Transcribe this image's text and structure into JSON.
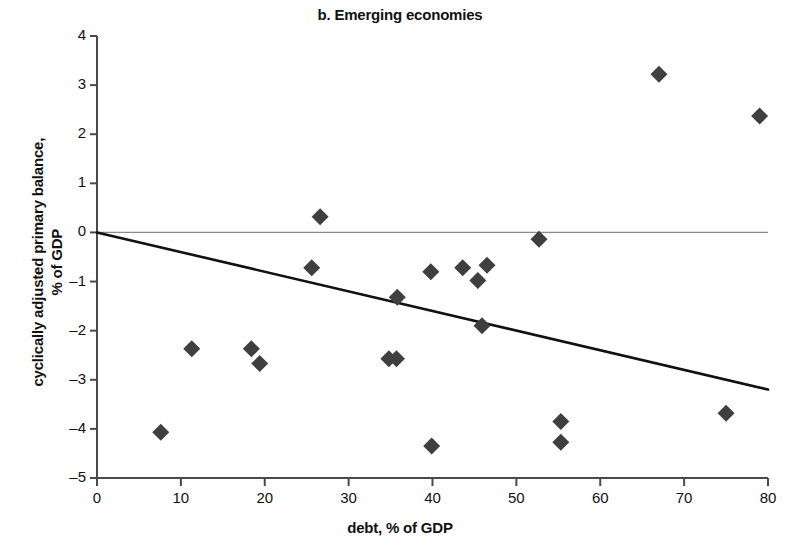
{
  "chart_data": {
    "type": "scatter",
    "title": "b. Emerging economies",
    "xlabel": "debt, % of GDP",
    "ylabel": "cyclically adjusted primary balance,\n% of GDP",
    "ylabel_line1": "cyclically adjusted primary balance,",
    "ylabel_line2": "% of GDP",
    "xlim": [
      0,
      80
    ],
    "ylim": [
      -5,
      4
    ],
    "xticks": [
      0,
      10,
      20,
      30,
      40,
      50,
      60,
      70,
      80
    ],
    "yticks": [
      4,
      3,
      2,
      1,
      0,
      -1,
      -2,
      -3,
      -4,
      -5
    ],
    "xtick_labels": [
      "0",
      "10",
      "20",
      "30",
      "40",
      "50",
      "60",
      "70",
      "80"
    ],
    "ytick_labels": [
      "4",
      "3",
      "2",
      "1",
      "0",
      "–1",
      "–2",
      "–3",
      "–4",
      "–5"
    ],
    "grid": false,
    "legend": null,
    "marker": "diamond",
    "marker_color": "#3f3f3f",
    "points": [
      {
        "x": 7.6,
        "y": -4.07
      },
      {
        "x": 11.3,
        "y": -2.37
      },
      {
        "x": 18.4,
        "y": -2.37
      },
      {
        "x": 19.4,
        "y": -2.67
      },
      {
        "x": 26.6,
        "y": 0.32
      },
      {
        "x": 25.6,
        "y": -0.72
      },
      {
        "x": 34.8,
        "y": -2.57
      },
      {
        "x": 35.7,
        "y": -2.57
      },
      {
        "x": 35.8,
        "y": -1.32
      },
      {
        "x": 39.8,
        "y": -0.8
      },
      {
        "x": 39.9,
        "y": -4.35
      },
      {
        "x": 43.6,
        "y": -0.72
      },
      {
        "x": 45.4,
        "y": -0.98
      },
      {
        "x": 46.5,
        "y": -0.67
      },
      {
        "x": 45.9,
        "y": -1.9
      },
      {
        "x": 52.7,
        "y": -0.14
      },
      {
        "x": 55.3,
        "y": -3.85
      },
      {
        "x": 55.3,
        "y": -4.27
      },
      {
        "x": 67.0,
        "y": 3.22
      },
      {
        "x": 75.0,
        "y": -3.68
      },
      {
        "x": 79.0,
        "y": 2.37
      }
    ],
    "trendline": {
      "name": "fitted regression line",
      "x0": 0,
      "y0": 0.0,
      "x1": 80,
      "y1": -3.2,
      "color": "#111111"
    },
    "zero_line": {
      "name": "zero reference line",
      "y": 0,
      "color": "#8a8a8a"
    }
  },
  "axis_colors": {
    "axis": "#4a4a4a",
    "text": "#111111"
  }
}
